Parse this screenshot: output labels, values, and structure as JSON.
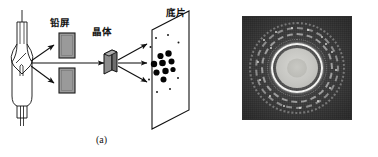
{
  "figure": {
    "panels": [
      {
        "id": "a",
        "caption": "(a)",
        "kind": "schematic"
      },
      {
        "id": "b",
        "caption": "(b)",
        "kind": "photograph"
      }
    ]
  },
  "panel_a": {
    "caption": "(a)",
    "labels": {
      "lead_screen": "铅屏",
      "crystal": "晶体",
      "film": "底片"
    },
    "components": {
      "xray_tube_name": "x-ray-tube",
      "lead_screen_upper_name": "lead-screen-upper",
      "lead_screen_lower_name": "lead-screen-lower",
      "crystal_name": "crystal-block",
      "film_plate_name": "film-plate"
    },
    "beams": {
      "source_rays": 3,
      "diffracted_rays": 3
    },
    "spots": {
      "large_count": 9,
      "small_count": 8,
      "large": [
        {
          "cx": 160.5,
          "cy": 56.0,
          "r": 3.1
        },
        {
          "cx": 168.5,
          "cy": 53.5,
          "r": 3.2
        },
        {
          "cx": 154.0,
          "cy": 64.0,
          "r": 3.2
        },
        {
          "cx": 162.5,
          "cy": 63.0,
          "r": 3.3
        },
        {
          "cx": 171.5,
          "cy": 61.5,
          "r": 3.0
        },
        {
          "cx": 156.5,
          "cy": 72.5,
          "r": 3.1
        },
        {
          "cx": 165.5,
          "cy": 71.0,
          "r": 3.2
        },
        {
          "cx": 173.0,
          "cy": 69.5,
          "r": 2.6
        },
        {
          "cx": 163.5,
          "cy": 79.5,
          "r": 3.0
        }
      ],
      "small": [
        {
          "cx": 156.0,
          "cy": 38.0,
          "r": 1.0
        },
        {
          "cx": 168.0,
          "cy": 35.0,
          "r": 1.0
        },
        {
          "cx": 178.5,
          "cy": 42.5,
          "r": 1.0
        },
        {
          "cx": 150.5,
          "cy": 47.0,
          "r": 1.0
        },
        {
          "cx": 149.0,
          "cy": 79.5,
          "r": 1.0
        },
        {
          "cx": 157.0,
          "cy": 92.0,
          "r": 1.0
        },
        {
          "cx": 170.0,
          "cy": 89.0,
          "r": 1.0
        },
        {
          "cx": 178.0,
          "cy": 78.0,
          "r": 1.0
        }
      ]
    }
  },
  "panel_b": {
    "caption": "(b)",
    "description": "powder-diffraction ring photograph",
    "rings": [
      {
        "name": "outer-ring-3",
        "speckled": true
      },
      {
        "name": "outer-ring-2",
        "speckled": true
      },
      {
        "name": "outer-ring-1",
        "speckled": true
      },
      {
        "name": "inner-halo",
        "speckled": true
      },
      {
        "name": "bright-ring",
        "speckled": false
      },
      {
        "name": "central-disc",
        "speckled": false
      },
      {
        "name": "disc-core",
        "speckled": false
      }
    ]
  },
  "colors": {
    "background": "#ffffff",
    "ink": "#111111",
    "screen_fill": "#9a9a9a",
    "crystal_face": "#8c8c8c",
    "crystal_side": "#6e6e6e",
    "photo_background": "#3a3a3a",
    "photo_highlight": "#f2f2f0",
    "disc_fill": "#c6c6c2"
  }
}
